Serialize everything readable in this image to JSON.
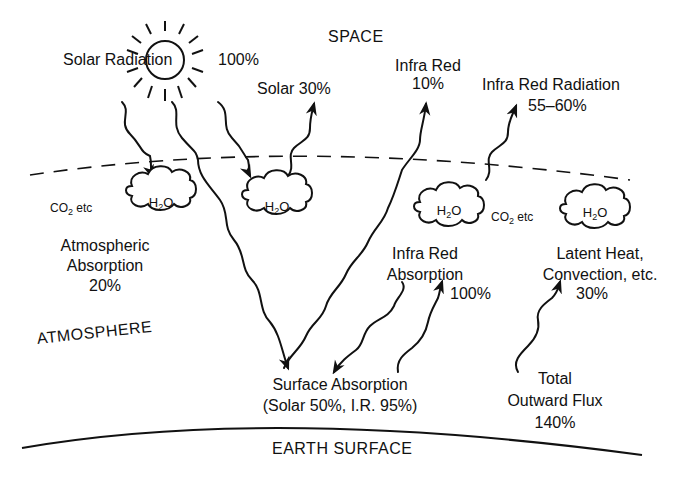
{
  "regions": {
    "space": "SPACE",
    "atmosphere": "ATMOSPHERE",
    "earth_surface": "EARTH SURFACE"
  },
  "labels": {
    "solar_radiation": "Solar Radiation",
    "solar_radiation_pct": "100%",
    "solar_reflected": "Solar 30%",
    "infra_red_line1": "Infra Red",
    "infra_red_pct": "10%",
    "ir_radiation_line1": "Infra Red Radiation",
    "ir_radiation_pct": "55–60%",
    "atm_abs_line1": "Atmospheric",
    "atm_abs_line2": "Absorption",
    "atm_abs_pct": "20%",
    "ir_abs_line1": "Infra Red",
    "ir_abs_line2": "Absorption",
    "ir_abs_pct": "100%",
    "latent_line1": "Latent Heat,",
    "latent_line2": "Convection, etc.",
    "latent_pct": "30%",
    "surface_line1": "Surface Absorption",
    "surface_line2": "(Solar 50%, I.R. 95%)",
    "total_line1": "Total",
    "total_line2": "Outward Flux",
    "total_pct": "140%"
  },
  "clouds": [
    {
      "id": "cloud-left",
      "main": "H",
      "sub": "2",
      "tail": "O"
    },
    {
      "id": "cloud-center",
      "main": "H",
      "sub": "2",
      "tail": "O"
    },
    {
      "id": "cloud-right-1",
      "main": "H",
      "sub": "2",
      "tail": "O"
    },
    {
      "id": "cloud-right-2",
      "main": "H",
      "sub": "2",
      "tail": "O"
    }
  ],
  "gases": [
    {
      "main": "CO",
      "sub": "2",
      "tail": " etc"
    },
    {
      "main": "CO",
      "sub": "2",
      "tail": " etc"
    }
  ],
  "colors": {
    "ink": "#111111",
    "background": "#ffffff"
  }
}
